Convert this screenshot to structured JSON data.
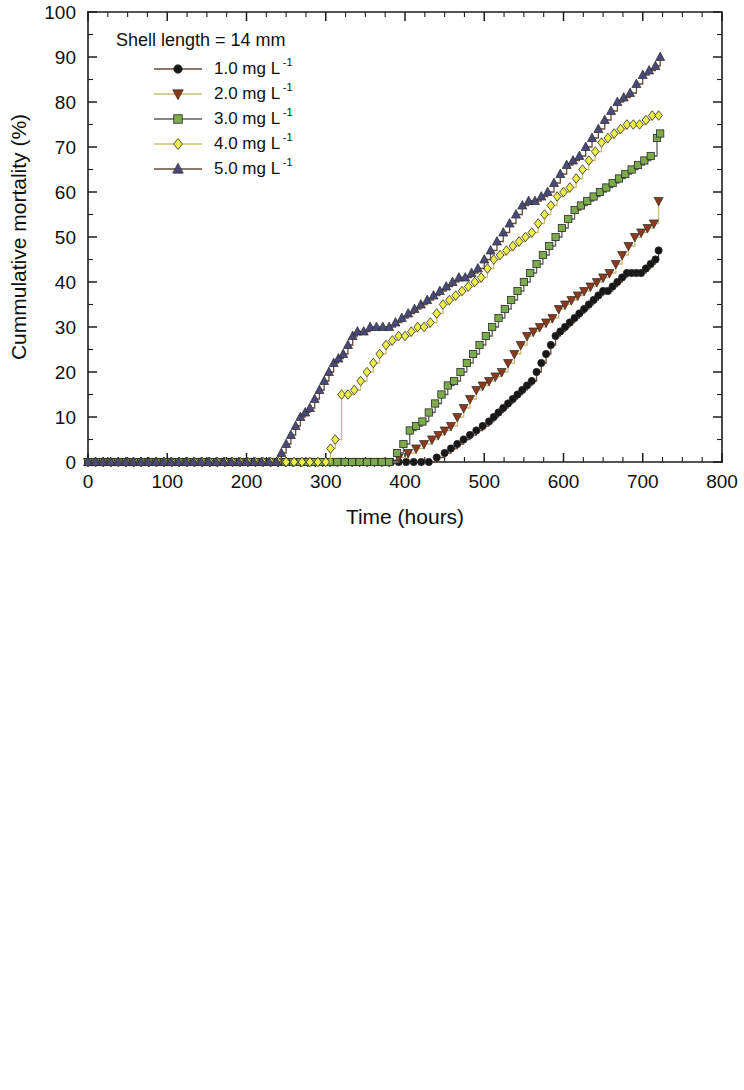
{
  "figure": {
    "background": "#ffffff",
    "panels": [
      "top",
      "bottom"
    ]
  },
  "axes": {
    "x_title": "Time (hours)",
    "y_title": "Cummulative mortality (%)",
    "x_ticklabels": [
      "0",
      "100",
      "200",
      "300",
      "400",
      "500",
      "600",
      "700",
      "800"
    ],
    "y_ticklabels": [
      "0",
      "10",
      "20",
      "30",
      "40",
      "50",
      "60",
      "70",
      "80",
      "90",
      "100"
    ]
  },
  "legend": {
    "entries": [
      {
        "label": "1.0 mg L",
        "sup": "-1",
        "marker": "circle",
        "color": "#171717",
        "line_color": "#6b4a3a"
      },
      {
        "label": "2.0 mg L",
        "sup": "-1",
        "marker": "triangle-down",
        "color": "#8d3a1c",
        "line_color": "#c9bd7a"
      },
      {
        "label": "3.0 mg L",
        "sup": "-1",
        "marker": "square",
        "color": "#7cab4c",
        "line_color": "#5d5d5d"
      },
      {
        "label": "4.0 mg L",
        "sup": "-1",
        "marker": "diamond",
        "color": "#eded4a",
        "line_color": "#cdc06a"
      },
      {
        "label": "5.0 mg L",
        "sup": "-1",
        "marker": "triangle-up",
        "color": "#4a4a7a",
        "line_color": "#6b4a3a"
      }
    ]
  },
  "chart_data": [
    {
      "type": "line",
      "panel": "top",
      "title": "Shell length = 14 mm",
      "xlabel": "Time (hours)",
      "ylabel": "Cummulative mortality (%)",
      "xlim": [
        0,
        800
      ],
      "ylim": [
        0,
        100
      ],
      "xticks": [
        0,
        100,
        200,
        300,
        400,
        500,
        600,
        700,
        800
      ],
      "yticks": [
        0,
        10,
        20,
        30,
        40,
        50,
        60,
        70,
        80,
        90,
        100
      ],
      "x_minor_step": 25,
      "y_minor_step": 5,
      "grid": false,
      "legend_position": "upper-left-inside",
      "series": [
        {
          "name": "1.0 mg L-1",
          "marker": "circle",
          "color": "#171717",
          "line_color": "#6b4a3a",
          "x": [
            0,
            240,
            430,
            440,
            450,
            458,
            466,
            474,
            482,
            490,
            498,
            506,
            512,
            518,
            524,
            530,
            536,
            542,
            548,
            554,
            560,
            566,
            572,
            578,
            584,
            590,
            596,
            602,
            608,
            614,
            620,
            626,
            632,
            638,
            644,
            650,
            656,
            662,
            668,
            674,
            680,
            686,
            692,
            698,
            704,
            710,
            716,
            720
          ],
          "y": [
            0,
            0,
            0,
            1,
            2,
            3,
            4,
            5,
            6,
            7,
            8,
            9,
            10,
            11,
            12,
            13,
            14,
            15,
            16,
            17,
            18,
            20,
            22,
            24,
            26,
            28,
            29,
            30,
            31,
            32,
            33,
            34,
            35,
            36,
            37,
            38,
            38,
            39,
            40,
            41,
            42,
            42,
            42,
            42,
            43,
            44,
            45,
            47
          ]
        },
        {
          "name": "2.0 mg L-1",
          "marker": "triangle-down",
          "color": "#8d3a1c",
          "line_color": "#c9bd7a",
          "x": [
            0,
            240,
            380,
            392,
            404,
            414,
            424,
            434,
            442,
            450,
            458,
            466,
            474,
            482,
            490,
            498,
            506,
            514,
            522,
            530,
            538,
            546,
            554,
            562,
            570,
            578,
            586,
            594,
            602,
            610,
            618,
            626,
            634,
            642,
            650,
            658,
            666,
            674,
            682,
            690,
            698,
            706,
            714,
            720
          ],
          "y": [
            0,
            0,
            0,
            1,
            2,
            3,
            4,
            5,
            6,
            7,
            8,
            10,
            12,
            14,
            16,
            17,
            18,
            19,
            20,
            22,
            24,
            26,
            28,
            29,
            30,
            31,
            32,
            34,
            35,
            36,
            37,
            38,
            39,
            40,
            41,
            42,
            44,
            46,
            48,
            50,
            51,
            52,
            53,
            58
          ]
        },
        {
          "name": "3.0 mg L-1",
          "marker": "square",
          "color": "#7cab4c",
          "line_color": "#5d5d5d",
          "x": [
            0,
            240,
            380,
            390,
            398,
            406,
            414,
            422,
            430,
            438,
            446,
            454,
            462,
            470,
            478,
            486,
            494,
            502,
            510,
            518,
            526,
            534,
            542,
            550,
            558,
            566,
            574,
            582,
            590,
            598,
            606,
            614,
            622,
            630,
            638,
            646,
            654,
            662,
            670,
            678,
            686,
            694,
            702,
            710,
            718,
            722
          ],
          "y": [
            0,
            0,
            0,
            2,
            4,
            7,
            8,
            9,
            11,
            13,
            15,
            17,
            18,
            20,
            22,
            24,
            26,
            28,
            30,
            32,
            34,
            36,
            38,
            40,
            42,
            44,
            46,
            48,
            50,
            52,
            54,
            56,
            57,
            58,
            59,
            60,
            61,
            62,
            63,
            64,
            65,
            66,
            67,
            68,
            72,
            73
          ]
        },
        {
          "name": "4.0 mg L-1",
          "marker": "diamond",
          "color": "#eded4a",
          "line_color": "#cdc06a",
          "x": [
            0,
            240,
            300,
            306,
            312,
            320,
            328,
            336,
            344,
            352,
            360,
            368,
            376,
            384,
            392,
            400,
            408,
            416,
            424,
            432,
            440,
            448,
            456,
            464,
            472,
            480,
            488,
            496,
            504,
            512,
            520,
            528,
            536,
            544,
            552,
            560,
            568,
            576,
            584,
            592,
            600,
            608,
            616,
            624,
            632,
            640,
            648,
            656,
            664,
            672,
            680,
            688,
            696,
            704,
            712,
            720
          ],
          "y": [
            0,
            0,
            0,
            3,
            5,
            15,
            15,
            16,
            18,
            20,
            22,
            24,
            26,
            27,
            28,
            28,
            29,
            30,
            30,
            31,
            33,
            35,
            36,
            37,
            38,
            39,
            40,
            41,
            43,
            45,
            46,
            47,
            48,
            49,
            50,
            51,
            53,
            55,
            57,
            59,
            60,
            61,
            63,
            65,
            67,
            69,
            71,
            72,
            73,
            74,
            75,
            75,
            75,
            76,
            77,
            77
          ]
        },
        {
          "name": "5.0 mg L-1",
          "marker": "triangle-up",
          "color": "#4a4a7a",
          "line_color": "#6b4a3a",
          "x": [
            0,
            238,
            244,
            250,
            256,
            262,
            268,
            274,
            280,
            286,
            292,
            298,
            304,
            310,
            316,
            322,
            328,
            334,
            340,
            348,
            356,
            364,
            372,
            380,
            388,
            396,
            404,
            412,
            420,
            428,
            436,
            444,
            452,
            460,
            468,
            476,
            484,
            492,
            500,
            508,
            516,
            524,
            532,
            540,
            548,
            556,
            564,
            572,
            580,
            588,
            596,
            604,
            612,
            620,
            628,
            636,
            644,
            652,
            660,
            668,
            676,
            684,
            692,
            700,
            708,
            716,
            722
          ],
          "y": [
            0,
            0,
            2,
            4,
            6,
            8,
            10,
            11,
            12,
            14,
            16,
            18,
            20,
            22,
            23,
            24,
            26,
            28,
            29,
            29,
            30,
            30,
            30,
            30,
            31,
            32,
            33,
            34,
            35,
            36,
            37,
            38,
            39,
            40,
            41,
            41,
            42,
            43,
            45,
            47,
            49,
            51,
            53,
            55,
            57,
            58,
            58,
            59,
            60,
            62,
            64,
            66,
            67,
            68,
            70,
            72,
            74,
            76,
            78,
            80,
            81,
            82,
            84,
            86,
            87,
            88,
            90
          ]
        }
      ]
    },
    {
      "type": "line",
      "panel": "bottom",
      "title": "Shell length = 25 mm",
      "xlabel": "Time (hours)",
      "ylabel": "Cummulative mortality (%)",
      "xlim": [
        0,
        800
      ],
      "ylim": [
        0,
        100
      ],
      "xticks": [
        0,
        100,
        200,
        300,
        400,
        500,
        600,
        700,
        800
      ],
      "yticks": [
        0,
        10,
        20,
        30,
        40,
        50,
        60,
        70,
        80,
        90,
        100
      ],
      "x_minor_step": 25,
      "y_minor_step": 5,
      "grid": false,
      "legend_position": "upper-left-inside",
      "series": [
        {
          "name": "1.0 mg L-1",
          "marker": "circle",
          "color": "#171717",
          "line_color": "#6b4a3a",
          "x": [
            0,
            330,
            505,
            516,
            526,
            536,
            546,
            556,
            566,
            576,
            586,
            596,
            606,
            616,
            626,
            636,
            646,
            656,
            666,
            676,
            686,
            696,
            706,
            716,
            726
          ],
          "y": [
            0,
            0,
            0,
            2,
            4,
            6,
            9,
            12,
            13,
            14,
            16,
            18,
            20,
            22,
            24,
            26,
            28,
            30,
            32,
            34,
            36,
            38,
            42,
            45,
            45
          ]
        },
        {
          "name": "2.0 mg L-1",
          "marker": "triangle-down",
          "color": "#8d3a1c",
          "line_color": "#c9bd7a",
          "x": [
            0,
            330,
            500,
            510,
            520,
            530,
            540,
            550,
            560,
            570,
            580,
            590,
            600,
            610,
            620,
            630,
            640,
            650,
            660,
            670,
            680,
            690,
            700,
            710,
            720,
            726
          ],
          "y": [
            0,
            0,
            0,
            3,
            6,
            9,
            12,
            15,
            17,
            19,
            21,
            23,
            25,
            27,
            29,
            31,
            34,
            37,
            40,
            43,
            46,
            48,
            50,
            52,
            56,
            56
          ]
        },
        {
          "name": "3.0 mg L-1",
          "marker": "square",
          "color": "#7cab4c",
          "line_color": "#5d5d5d",
          "x": [
            0,
            330,
            432,
            440,
            450,
            460,
            470,
            480,
            490,
            500,
            510,
            520,
            530,
            540,
            550,
            560,
            570,
            580,
            590,
            600,
            610,
            620,
            630,
            640,
            650,
            660,
            670,
            680,
            690,
            700,
            710,
            720,
            726
          ],
          "y": [
            0,
            0,
            0,
            3,
            8,
            10,
            14,
            16,
            18,
            20,
            22,
            24,
            26,
            28,
            31,
            33,
            36,
            38,
            40,
            43,
            46,
            49,
            52,
            54,
            56,
            58,
            60,
            62,
            64,
            65,
            66,
            66,
            66
          ]
        },
        {
          "name": "4.0 mg L-1",
          "marker": "diamond",
          "color": "#eded4a",
          "line_color": "#cdc06a",
          "x": [
            0,
            326,
            380,
            390,
            400,
            410,
            420,
            430,
            440,
            450,
            460,
            470,
            480,
            490,
            500,
            510,
            520,
            530,
            540,
            550,
            560,
            570,
            580,
            590,
            600,
            610,
            620,
            630,
            640,
            650,
            660,
            670,
            680,
            690,
            700,
            710,
            720,
            726
          ],
          "y": [
            0,
            0,
            0,
            7,
            12,
            12,
            12,
            13,
            13,
            14,
            16,
            18,
            20,
            22,
            24,
            26,
            28,
            31,
            34,
            38,
            42,
            50,
            57,
            57,
            57,
            57,
            58,
            59,
            60,
            61,
            62,
            63,
            64,
            66,
            68,
            70,
            70,
            70
          ]
        },
        {
          "name": "5.0 mg L-1",
          "marker": "triangle-up",
          "color": "#4a4a7a",
          "line_color": "#6b4a3a",
          "x": [
            0,
            330,
            340,
            350,
            356,
            362,
            370,
            378,
            386,
            394,
            402,
            410,
            418,
            426,
            434,
            442,
            450,
            458,
            466,
            474,
            482,
            490,
            498,
            506,
            514,
            522,
            530,
            538,
            546,
            554,
            562,
            570,
            578,
            586,
            594,
            602,
            610,
            618,
            626,
            634,
            642,
            650,
            658,
            666,
            674,
            682,
            690,
            698,
            706,
            714,
            722,
            728
          ],
          "y": [
            0,
            0,
            5,
            5,
            3,
            6,
            8,
            10,
            12,
            14,
            16,
            18,
            20,
            21,
            22,
            22,
            20,
            21,
            22,
            23,
            24,
            26,
            28,
            30,
            31,
            32,
            32,
            32,
            32,
            33,
            34,
            36,
            38,
            40,
            42,
            44,
            46,
            48,
            50,
            52,
            54,
            56,
            58,
            60,
            62,
            64,
            66,
            70,
            73,
            76,
            80,
            81
          ]
        }
      ]
    }
  ]
}
